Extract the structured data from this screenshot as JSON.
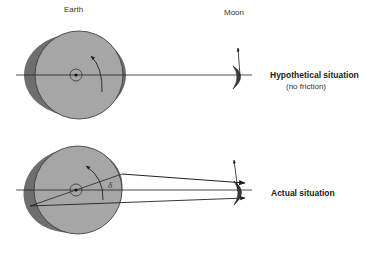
{
  "labels": {
    "earth": "Earth",
    "moon": "Moon",
    "delta": "δ"
  },
  "panels": [
    {
      "id": "hypothetical",
      "title": "Hypothetical situation",
      "subtitle": "(no friction)"
    },
    {
      "id": "actual",
      "title": "Actual situation",
      "subtitle": ""
    }
  ],
  "colors": {
    "earth_fill": "#a6a6a6",
    "earth_bulge": "#6e6e6e",
    "moon_fill": "#3a3a3a",
    "line": "#222222",
    "background": "#ffffff"
  }
}
